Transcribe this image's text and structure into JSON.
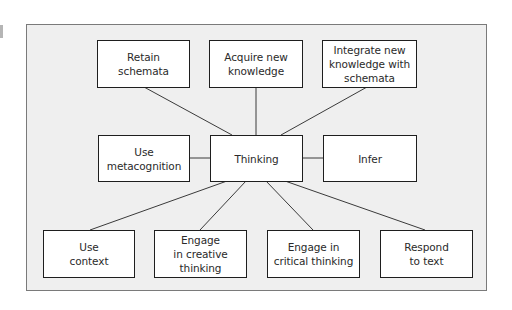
{
  "diagram": {
    "type": "hub-and-spoke concept map",
    "center": {
      "id": "thinking",
      "label": "Thinking"
    },
    "nodes": {
      "retain": {
        "label": "Retain\nschemata"
      },
      "acquire": {
        "label": "Acquire new\nknowledge"
      },
      "integrate": {
        "label": "Integrate new\nknowledge with\nschemata"
      },
      "metacognition": {
        "label": "Use\nmetacognition"
      },
      "thinking": {
        "label": "Thinking"
      },
      "infer": {
        "label": "Infer"
      },
      "context": {
        "label": "Use\ncontext"
      },
      "creative": {
        "label": "Engage\nin creative\nthinking"
      },
      "critical": {
        "label": "Engage in\ncritical thinking"
      },
      "respond": {
        "label": "Respond\nto text"
      }
    },
    "edges": [
      {
        "from": "thinking",
        "to": "retain"
      },
      {
        "from": "thinking",
        "to": "acquire"
      },
      {
        "from": "thinking",
        "to": "integrate"
      },
      {
        "from": "thinking",
        "to": "metacognition"
      },
      {
        "from": "thinking",
        "to": "infer"
      },
      {
        "from": "thinking",
        "to": "context"
      },
      {
        "from": "thinking",
        "to": "creative"
      },
      {
        "from": "thinking",
        "to": "critical"
      },
      {
        "from": "thinking",
        "to": "respond"
      }
    ],
    "colors": {
      "frame_background": "#efefef",
      "frame_border": "#7a7a7a",
      "node_background": "#ffffff",
      "node_border": "#1e1e1e",
      "line": "#3a3a3a",
      "text": "#2a2a2a"
    }
  }
}
